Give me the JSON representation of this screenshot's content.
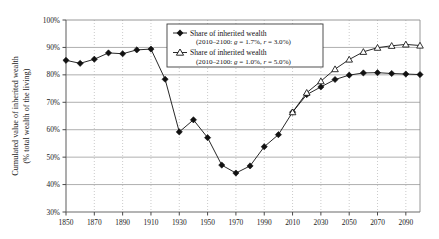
{
  "chart_data": {
    "type": "line",
    "title": "",
    "xlabel": "",
    "ylabel": "Cumulated value of inherited wealth (% total wealth of the living)",
    "ylabel_line1": "Cumulated value of inherited wealth",
    "ylabel_line2": "(% total wealth of the living)",
    "xlim": [
      1850,
      2100
    ],
    "ylim": [
      30,
      100
    ],
    "ytick_labels": [
      "100%",
      "90%",
      "80%",
      "70%",
      "60%",
      "50%",
      "40%",
      "30%"
    ],
    "ytick_values": [
      100,
      90,
      80,
      70,
      60,
      50,
      40,
      30
    ],
    "xtick_labels": [
      "1850",
      "1870",
      "1890",
      "1910",
      "1930",
      "1950",
      "1970",
      "1990",
      "2010",
      "2030",
      "2050",
      "2070",
      "2090"
    ],
    "xtick_values": [
      1850,
      1870,
      1890,
      1910,
      1930,
      1950,
      1970,
      1990,
      2010,
      2030,
      2050,
      2070,
      2090
    ],
    "grid": true,
    "legend_position": "top-center",
    "x": [
      1850,
      1860,
      1870,
      1880,
      1890,
      1900,
      1910,
      1920,
      1930,
      1940,
      1950,
      1960,
      1970,
      1980,
      1990,
      2000,
      2010,
      2020,
      2030,
      2040,
      2050,
      2060,
      2070,
      2080,
      2090,
      2100
    ],
    "series": [
      {
        "name": "Share of inherited wealth",
        "sub": "(2010–2100: g = 1.7%, r = 3.0%)",
        "marker": "filled-diamond",
        "color": "#111111",
        "values": [
          85.3,
          84.2,
          85.7,
          88.0,
          87.7,
          89.1,
          89.4,
          78.4,
          59.2,
          63.6,
          57.1,
          47.1,
          44.2,
          46.8,
          53.8,
          58.2,
          66.4,
          72.8,
          75.6,
          78.3,
          79.9,
          80.7,
          80.8,
          80.5,
          80.3,
          80.1
        ]
      },
      {
        "name": "Share of inherited wealth",
        "sub": "(2010–2100: g = 1.0%, r = 5.0%)",
        "marker": "open-triangle",
        "color": "#111111",
        "values": [
          null,
          null,
          null,
          null,
          null,
          null,
          null,
          null,
          null,
          null,
          null,
          null,
          null,
          null,
          null,
          null,
          66.4,
          73.5,
          77.7,
          82.1,
          85.6,
          88.4,
          89.9,
          90.6,
          91.1,
          90.7
        ]
      }
    ]
  },
  "legend": {
    "entries": [
      {
        "label": "Share of inherited wealth",
        "detail_prefix": "(2010–2100: ",
        "g_sym": "g",
        "g_val": " = 1.7%, ",
        "r_sym": "r",
        "r_val": " = 3.0%)",
        "marker": "filled-diamond"
      },
      {
        "label": "Share of inherited wealth",
        "detail_prefix": "(2010–2100: ",
        "g_sym": "g",
        "g_val": " = 1.0%, ",
        "r_sym": "r",
        "r_val": " = 5.0%)",
        "marker": "open-triangle"
      }
    ]
  },
  "colors": {
    "line": "#111111",
    "grid_solid": "#9a9a9a",
    "grid_dotted": "#b4b4b4",
    "axis": "#4a4a4a",
    "background": "#ffffff"
  }
}
